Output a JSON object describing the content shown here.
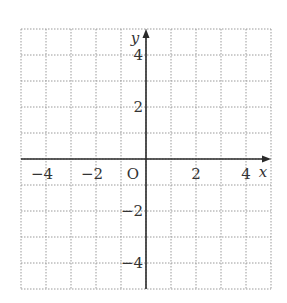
{
  "diagram": {
    "type": "coordinate-grid",
    "x_axis": {
      "label": "x",
      "min": -5,
      "max": 5,
      "tick_labels": [
        {
          "value": -4,
          "text": "−4"
        },
        {
          "value": -2,
          "text": "−2"
        },
        {
          "value": 2,
          "text": "2"
        },
        {
          "value": 4,
          "text": "4"
        }
      ]
    },
    "y_axis": {
      "label": "y",
      "min": -5,
      "max": 5,
      "tick_labels": [
        {
          "value": 4,
          "text": "4"
        },
        {
          "value": 2,
          "text": "2"
        },
        {
          "value": -2,
          "text": "−2"
        },
        {
          "value": -4,
          "text": "−4"
        }
      ]
    },
    "origin_label": "O",
    "grid_step": 1,
    "colors": {
      "axis": "#2a2a2a",
      "grid": "#9a9a9a",
      "text": "#333333"
    }
  }
}
